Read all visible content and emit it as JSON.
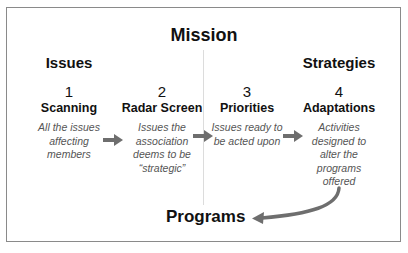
{
  "diagram": {
    "title": "Mission",
    "groups": {
      "left": "Issues",
      "right": "Strategies"
    },
    "steps": [
      {
        "number": "1",
        "name": "Scanning",
        "description": "All the issues affecting members"
      },
      {
        "number": "2",
        "name": "Radar Screen",
        "description": "Issues the association deems to be “strategic”"
      },
      {
        "number": "3",
        "name": "Priorities",
        "description": "Issues ready to be acted upon"
      },
      {
        "number": "4",
        "name": "Adaptations",
        "description": "Activities designed to alter the programs offered"
      }
    ],
    "outcome": "Programs",
    "colors": {
      "arrow": "#6e6e6e",
      "border": "#8a8a8a",
      "divider": "#dcdcdc",
      "description_text": "#555555"
    }
  }
}
